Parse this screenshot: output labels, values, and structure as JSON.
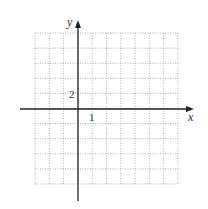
{
  "chart_data": {
    "type": "line",
    "title": "",
    "xlabel": "x",
    "ylabel": "y",
    "x_tick_label": "1",
    "y_tick_label": "2",
    "x_unit": 1,
    "y_unit": 2,
    "xlim": [
      -3,
      7
    ],
    "ylim": [
      -10,
      10
    ],
    "grid": true,
    "grid_style": "dotted",
    "grid_columns": 10,
    "grid_rows": 10,
    "series": []
  },
  "colors": {
    "axis": "#222222",
    "grid": "#9a9a9a",
    "label": "#333333"
  },
  "layout": {
    "grid_left": 35,
    "grid_top": 33,
    "grid_right": 178,
    "grid_bottom": 184,
    "x_axis_y": 109,
    "y_axis_x": 78,
    "x_axis_start": 20,
    "x_axis_end": 194,
    "y_axis_top": 20,
    "y_axis_bottom": 201
  }
}
